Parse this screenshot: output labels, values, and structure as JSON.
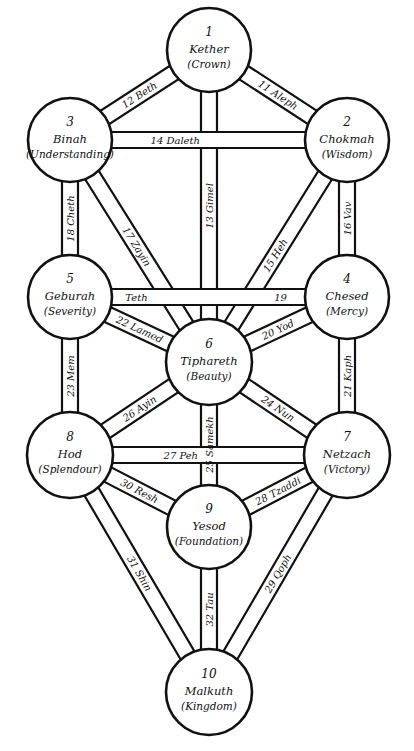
{
  "diagram": {
    "colors": {
      "stroke": "#111111",
      "fill": "#ffffff",
      "background": "#ffffff"
    },
    "sephiroth": [
      {
        "id": 1,
        "number": "1",
        "name": "Kether",
        "meaning": "(Crown)",
        "cx": 209,
        "cy": 50,
        "r": 42
      },
      {
        "id": 2,
        "number": "2",
        "name": "Chokmah",
        "meaning": "(Wisdom)",
        "cx": 347,
        "cy": 140,
        "r": 42
      },
      {
        "id": 3,
        "number": "3",
        "name": "Binah",
        "meaning": "(Understanding)",
        "cx": 70,
        "cy": 140,
        "r": 42
      },
      {
        "id": 4,
        "number": "4",
        "name": "Chesed",
        "meaning": "(Mercy)",
        "cx": 347,
        "cy": 297,
        "r": 42
      },
      {
        "id": 5,
        "number": "5",
        "name": "Geburah",
        "meaning": "(Severity)",
        "cx": 70,
        "cy": 297,
        "r": 42
      },
      {
        "id": 6,
        "number": "6",
        "name": "Tiphareth",
        "meaning": "(Beauty)",
        "cx": 209,
        "cy": 362,
        "r": 43
      },
      {
        "id": 7,
        "number": "7",
        "name": "Netzach",
        "meaning": "(Victory)",
        "cx": 347,
        "cy": 455,
        "r": 43
      },
      {
        "id": 8,
        "number": "8",
        "name": "Hod",
        "meaning": "(Splendour)",
        "cx": 70,
        "cy": 455,
        "r": 43
      },
      {
        "id": 9,
        "number": "9",
        "name": "Yesod",
        "meaning": "(Foundation)",
        "cx": 209,
        "cy": 527,
        "r": 42
      },
      {
        "id": 10,
        "number": "10",
        "name": "Malkuth",
        "meaning": "(Kingdom)",
        "cx": 209,
        "cy": 692,
        "r": 43
      }
    ],
    "paths": [
      {
        "number": 11,
        "letter": "Aleph",
        "label": "11 Aleph",
        "from": 1,
        "to": 2
      },
      {
        "number": 12,
        "letter": "Beth",
        "label": "12 Beth",
        "from": 1,
        "to": 3
      },
      {
        "number": 13,
        "letter": "Gimel",
        "label": "13 Gimel",
        "from": 1,
        "to": 6
      },
      {
        "number": 14,
        "letter": "Daleth",
        "label": "14 Daleth",
        "from": 2,
        "to": 3
      },
      {
        "number": 15,
        "letter": "Heh",
        "label": "15 Heh",
        "from": 2,
        "to": 6
      },
      {
        "number": 16,
        "letter": "Vav",
        "label": "16 Vav",
        "from": 2,
        "to": 4
      },
      {
        "number": 17,
        "letter": "Zayin",
        "label": "17 Zayin",
        "from": 3,
        "to": 6
      },
      {
        "number": 18,
        "letter": "Cheth",
        "label": "18 Cheth",
        "from": 3,
        "to": 5
      },
      {
        "number": 19,
        "letter": "Teth",
        "label": "19",
        "label2": "Teth",
        "from": 4,
        "to": 5
      },
      {
        "number": 20,
        "letter": "Yod",
        "label": "20 Yod",
        "from": 4,
        "to": 6
      },
      {
        "number": 21,
        "letter": "Kaph",
        "label": "21 Kaph",
        "from": 4,
        "to": 7
      },
      {
        "number": 22,
        "letter": "Lamed",
        "label": "22 Lamed",
        "from": 5,
        "to": 6
      },
      {
        "number": 23,
        "letter": "Mem",
        "label": "23 Mem",
        "from": 5,
        "to": 8
      },
      {
        "number": 24,
        "letter": "Nun",
        "label": "24 Nun",
        "from": 6,
        "to": 7
      },
      {
        "number": 25,
        "letter": "Samekh",
        "label": "25 Samekh",
        "from": 6,
        "to": 9
      },
      {
        "number": 26,
        "letter": "Ayin",
        "label": "26 Ayin",
        "from": 6,
        "to": 8
      },
      {
        "number": 27,
        "letter": "Peh",
        "label": "27 Peh",
        "from": 7,
        "to": 8
      },
      {
        "number": 28,
        "letter": "Tzaddi",
        "label": "28 Tzaddi",
        "from": 7,
        "to": 9
      },
      {
        "number": 29,
        "letter": "Qoph",
        "label": "29 Qoph",
        "from": 7,
        "to": 10
      },
      {
        "number": 30,
        "letter": "Resh",
        "label": "30 Resh",
        "from": 8,
        "to": 9
      },
      {
        "number": 31,
        "letter": "Shin",
        "label": "31 Shin",
        "from": 8,
        "to": 10
      },
      {
        "number": 32,
        "letter": "Tau",
        "label": "32 Tau",
        "from": 9,
        "to": 10
      }
    ]
  }
}
